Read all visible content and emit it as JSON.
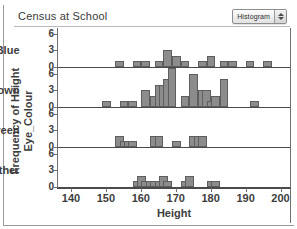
{
  "window": {
    "title": "Census at School"
  },
  "toolbar": {
    "plot_type_label": "Histogram",
    "stepper_up_icon": "triangle-up-icon",
    "stepper_down_icon": "triangle-down-icon"
  },
  "chart_data": {
    "type": "bar",
    "title": "Census at School",
    "xlabel": "Height",
    "ylabel": "Frequency of Height",
    "facet_label": "Eye_Colour",
    "xlim": [
      136,
      203
    ],
    "ylim": [
      0,
      7
    ],
    "xticks": [
      140,
      150,
      160,
      170,
      180,
      190,
      200
    ],
    "yticks": [
      0,
      3,
      6
    ],
    "grid": false,
    "legend": "none",
    "bin_width": 2.5,
    "panels": [
      {
        "name": "Blue",
        "bins": [
          {
            "x": 153.75,
            "value": 1
          },
          {
            "x": 158.75,
            "value": 1
          },
          {
            "x": 161.25,
            "value": 1
          },
          {
            "x": 165.0,
            "value": 1
          },
          {
            "x": 167.5,
            "value": 3
          },
          {
            "x": 170.0,
            "value": 2
          },
          {
            "x": 172.5,
            "value": 1
          },
          {
            "x": 177.5,
            "value": 1
          },
          {
            "x": 180.0,
            "value": 2
          },
          {
            "x": 183.75,
            "value": 1
          },
          {
            "x": 186.25,
            "value": 1
          },
          {
            "x": 191.25,
            "value": 1
          },
          {
            "x": 196.25,
            "value": 1
          }
        ]
      },
      {
        "name": "Brown",
        "bins": [
          {
            "x": 150.0,
            "value": 1
          },
          {
            "x": 155.0,
            "value": 1
          },
          {
            "x": 157.5,
            "value": 1
          },
          {
            "x": 161.25,
            "value": 3
          },
          {
            "x": 163.75,
            "value": 2
          },
          {
            "x": 165.0,
            "value": 4
          },
          {
            "x": 166.25,
            "value": 4
          },
          {
            "x": 167.5,
            "value": 5
          },
          {
            "x": 168.75,
            "value": 7
          },
          {
            "x": 172.5,
            "value": 2
          },
          {
            "x": 175.0,
            "value": 6
          },
          {
            "x": 177.5,
            "value": 3
          },
          {
            "x": 178.75,
            "value": 3
          },
          {
            "x": 180.0,
            "value": 1
          },
          {
            "x": 181.25,
            "value": 2
          },
          {
            "x": 183.75,
            "value": 5
          },
          {
            "x": 192.5,
            "value": 1
          }
        ]
      },
      {
        "name": "Green",
        "bins": [
          {
            "x": 153.75,
            "value": 2
          },
          {
            "x": 155.0,
            "value": 1
          },
          {
            "x": 156.25,
            "value": 1
          },
          {
            "x": 157.5,
            "value": 1
          },
          {
            "x": 163.75,
            "value": 2
          },
          {
            "x": 165.0,
            "value": 2
          },
          {
            "x": 170.0,
            "value": 1
          },
          {
            "x": 175.0,
            "value": 2
          },
          {
            "x": 176.25,
            "value": 2
          },
          {
            "x": 177.5,
            "value": 2
          }
        ]
      },
      {
        "name": "Other",
        "bins": [
          {
            "x": 158.75,
            "value": 1
          },
          {
            "x": 160.0,
            "value": 2
          },
          {
            "x": 161.25,
            "value": 1
          },
          {
            "x": 162.5,
            "value": 1
          },
          {
            "x": 163.75,
            "value": 1
          },
          {
            "x": 165.0,
            "value": 1
          },
          {
            "x": 166.25,
            "value": 2
          },
          {
            "x": 167.5,
            "value": 1
          },
          {
            "x": 172.5,
            "value": 1
          },
          {
            "x": 173.75,
            "value": 2
          },
          {
            "x": 180.0,
            "value": 1
          },
          {
            "x": 181.25,
            "value": 1
          }
        ]
      }
    ]
  },
  "colors": {
    "bar_fill": "#8c8c8c",
    "bar_stroke": "#5e5e5e",
    "axis": "#4a4a4a",
    "text": "#3d3d3d"
  }
}
